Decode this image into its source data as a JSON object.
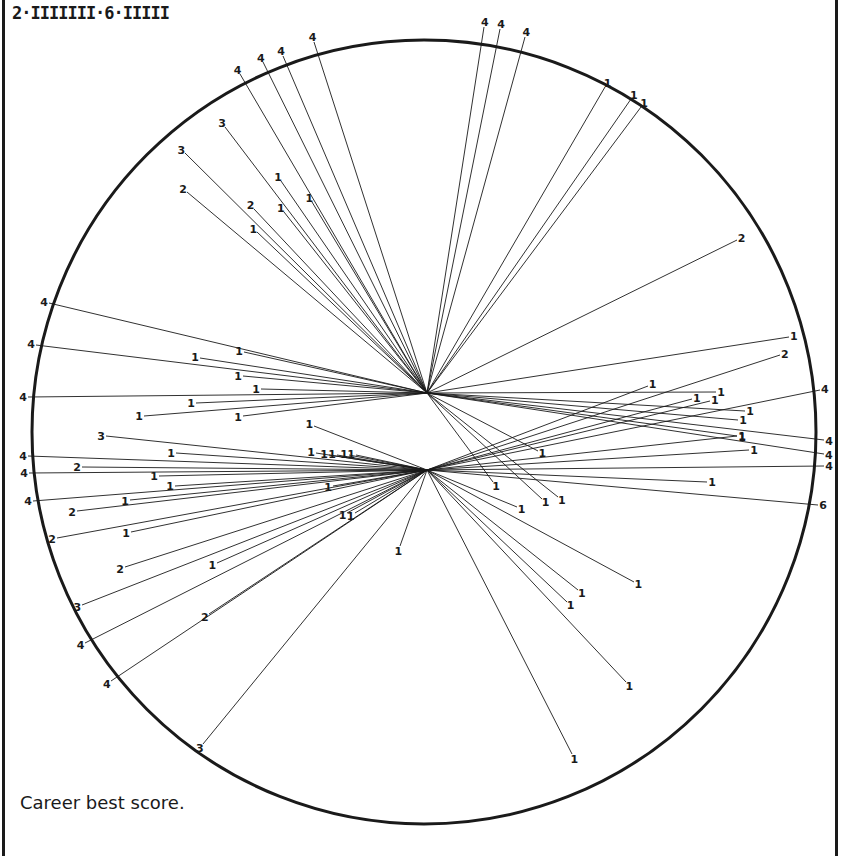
{
  "header": {
    "tally": "2·IIIIIII·6·IIIII"
  },
  "caption": "Career best score.",
  "colors": {
    "ink": "#1a1a1a",
    "paper": "#ffffff"
  },
  "chart_data": {
    "type": "radial-wagon-wheel",
    "title": "Career best score.",
    "tally": "2·IIIIIII·6·IIIII",
    "boundary_circle": {
      "cx": 424,
      "cy": 432,
      "r": 392
    },
    "hubs": [
      {
        "id": "A",
        "x": 427,
        "y": 393
      },
      {
        "id": "B",
        "x": 427,
        "y": 470
      }
    ],
    "legend": "Numbers at line ends denote runs scored per shot (1, 2, 3, 4, 6); lines radiate from batting positions at the hubs.",
    "shots": [
      {
        "hub": "A",
        "x": 484,
        "y": 27,
        "runs": 4
      },
      {
        "hub": "A",
        "x": 500,
        "y": 29,
        "runs": 4
      },
      {
        "hub": "A",
        "x": 525,
        "y": 37,
        "runs": 4
      },
      {
        "hub": "A",
        "x": 314,
        "y": 42,
        "runs": 4
      },
      {
        "hub": "A",
        "x": 283,
        "y": 56,
        "runs": 4
      },
      {
        "hub": "A",
        "x": 263,
        "y": 62,
        "runs": 4
      },
      {
        "hub": "A",
        "x": 240,
        "y": 74,
        "runs": 4
      },
      {
        "hub": "A",
        "x": 605,
        "y": 87,
        "runs": 1
      },
      {
        "hub": "A",
        "x": 631,
        "y": 99,
        "runs": 1
      },
      {
        "hub": "A",
        "x": 641,
        "y": 107,
        "runs": 1
      },
      {
        "hub": "A",
        "x": 225,
        "y": 127,
        "runs": 3
      },
      {
        "hub": "A",
        "x": 185,
        "y": 153,
        "runs": 3
      },
      {
        "hub": "A",
        "x": 187,
        "y": 192,
        "runs": 2
      },
      {
        "hub": "A",
        "x": 281,
        "y": 181,
        "runs": 1
      },
      {
        "hub": "A",
        "x": 312,
        "y": 202,
        "runs": 1
      },
      {
        "hub": "A",
        "x": 254,
        "y": 209,
        "runs": 2
      },
      {
        "hub": "A",
        "x": 284,
        "y": 212,
        "runs": 1
      },
      {
        "hub": "A",
        "x": 257,
        "y": 232,
        "runs": 1
      },
      {
        "hub": "A",
        "x": 737,
        "y": 240,
        "runs": 2
      },
      {
        "hub": "A",
        "x": 789,
        "y": 337,
        "runs": 1
      },
      {
        "hub": "A",
        "x": 716,
        "y": 392,
        "runs": 1
      },
      {
        "hub": "A",
        "x": 49,
        "y": 303,
        "runs": 4
      },
      {
        "hub": "A",
        "x": 36,
        "y": 345,
        "runs": 4
      },
      {
        "hub": "A",
        "x": 28,
        "y": 397,
        "runs": 4
      },
      {
        "hub": "A",
        "x": 244,
        "y": 352,
        "runs": 1
      },
      {
        "hub": "A",
        "x": 200,
        "y": 358,
        "runs": 1
      },
      {
        "hub": "A",
        "x": 243,
        "y": 376,
        "runs": 1
      },
      {
        "hub": "A",
        "x": 261,
        "y": 389,
        "runs": 1
      },
      {
        "hub": "A",
        "x": 196,
        "y": 403,
        "runs": 1
      },
      {
        "hub": "A",
        "x": 144,
        "y": 416,
        "runs": 1
      },
      {
        "hub": "A",
        "x": 243,
        "y": 416,
        "runs": 1
      },
      {
        "hub": "A",
        "x": 745,
        "y": 411,
        "runs": 1
      },
      {
        "hub": "A",
        "x": 738,
        "y": 420,
        "runs": 1
      },
      {
        "hub": "A",
        "x": 737,
        "y": 436,
        "runs": 1
      },
      {
        "hub": "A",
        "x": 824,
        "y": 440,
        "runs": 4
      },
      {
        "hub": "A",
        "x": 824,
        "y": 454,
        "runs": 4
      },
      {
        "hub": "A",
        "x": 538,
        "y": 451,
        "runs": 1
      },
      {
        "hub": "A",
        "x": 558,
        "y": 497,
        "runs": 1
      },
      {
        "hub": "A",
        "x": 542,
        "y": 499,
        "runs": 1
      },
      {
        "hub": "A",
        "x": 493,
        "y": 482,
        "runs": 1
      },
      {
        "hub": "B",
        "x": 82,
        "y": 467,
        "runs": 2
      },
      {
        "hub": "B",
        "x": 106,
        "y": 436,
        "runs": 3
      },
      {
        "hub": "B",
        "x": 176,
        "y": 453,
        "runs": 1
      },
      {
        "hub": "B",
        "x": 28,
        "y": 456,
        "runs": 4
      },
      {
        "hub": "B",
        "x": 29,
        "y": 473,
        "runs": 4
      },
      {
        "hub": "B",
        "x": 159,
        "y": 476,
        "runs": 1
      },
      {
        "hub": "B",
        "x": 175,
        "y": 486,
        "runs": 1
      },
      {
        "hub": "B",
        "x": 33,
        "y": 501,
        "runs": 4
      },
      {
        "hub": "B",
        "x": 130,
        "y": 500,
        "runs": 1
      },
      {
        "hub": "B",
        "x": 77,
        "y": 511,
        "runs": 2
      },
      {
        "hub": "B",
        "x": 57,
        "y": 538,
        "runs": 2
      },
      {
        "hub": "B",
        "x": 131,
        "y": 532,
        "runs": 1
      },
      {
        "hub": "B",
        "x": 125,
        "y": 567,
        "runs": 2
      },
      {
        "hub": "B",
        "x": 217,
        "y": 563,
        "runs": 1
      },
      {
        "hub": "B",
        "x": 82,
        "y": 605,
        "runs": 3
      },
      {
        "hub": "B",
        "x": 209,
        "y": 614,
        "runs": 2
      },
      {
        "hub": "B",
        "x": 85,
        "y": 643,
        "runs": 4
      },
      {
        "hub": "B",
        "x": 111,
        "y": 681,
        "runs": 4
      },
      {
        "hub": "B",
        "x": 203,
        "y": 744,
        "runs": 3
      },
      {
        "hub": "B",
        "x": 314,
        "y": 426,
        "runs": 1
      },
      {
        "hub": "B",
        "x": 316,
        "y": 453,
        "runs": 1
      },
      {
        "hub": "B",
        "x": 329,
        "y": 455,
        "runs": 1
      },
      {
        "hub": "B",
        "x": 337,
        "y": 455,
        "runs": 1
      },
      {
        "hub": "B",
        "x": 349,
        "y": 455,
        "runs": 1
      },
      {
        "hub": "B",
        "x": 356,
        "y": 455,
        "runs": 1
      },
      {
        "hub": "B",
        "x": 333,
        "y": 486,
        "runs": 1
      },
      {
        "hub": "B",
        "x": 347,
        "y": 513,
        "runs": 1
      },
      {
        "hub": "B",
        "x": 355,
        "y": 513,
        "runs": 1
      },
      {
        "hub": "B",
        "x": 400,
        "y": 546,
        "runs": 1
      },
      {
        "hub": "B",
        "x": 648,
        "y": 386,
        "runs": 1
      },
      {
        "hub": "B",
        "x": 692,
        "y": 399,
        "runs": 1
      },
      {
        "hub": "B",
        "x": 710,
        "y": 401,
        "runs": 1
      },
      {
        "hub": "B",
        "x": 780,
        "y": 355,
        "runs": 2
      },
      {
        "hub": "B",
        "x": 820,
        "y": 390,
        "runs": 4
      },
      {
        "hub": "B",
        "x": 737,
        "y": 436,
        "runs": 1
      },
      {
        "hub": "B",
        "x": 749,
        "y": 450,
        "runs": 1
      },
      {
        "hub": "B",
        "x": 824,
        "y": 466,
        "runs": 4
      },
      {
        "hub": "B",
        "x": 707,
        "y": 482,
        "runs": 1
      },
      {
        "hub": "B",
        "x": 818,
        "y": 505,
        "runs": 6
      },
      {
        "hub": "B",
        "x": 517,
        "y": 507,
        "runs": 1
      },
      {
        "hub": "B",
        "x": 634,
        "y": 582,
        "runs": 1
      },
      {
        "hub": "B",
        "x": 578,
        "y": 590,
        "runs": 1
      },
      {
        "hub": "B",
        "x": 567,
        "y": 602,
        "runs": 1
      },
      {
        "hub": "B",
        "x": 626,
        "y": 682,
        "runs": 1
      },
      {
        "hub": "B",
        "x": 572,
        "y": 754,
        "runs": 1
      }
    ]
  }
}
